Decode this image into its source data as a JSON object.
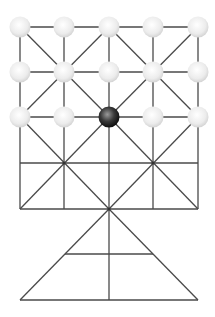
{
  "game": {
    "name": "board",
    "grid": {
      "cols_x": [
        20,
        64,
        109,
        153,
        198
      ],
      "rows_y": [
        27,
        72,
        117,
        163,
        209
      ]
    },
    "triangle": {
      "apex": [
        109,
        209
      ],
      "mid_y": 254,
      "mid_x": [
        65,
        153
      ],
      "base_y": 300,
      "base_x": [
        20,
        198
      ]
    },
    "colors": {
      "line": "#4a4a4a",
      "white_piece": "#efefef",
      "black_piece": "#2a2a2a",
      "background": "#ffffff"
    },
    "white_pieces": [
      [
        0,
        0
      ],
      [
        1,
        0
      ],
      [
        2,
        0
      ],
      [
        3,
        0
      ],
      [
        4,
        0
      ],
      [
        0,
        1
      ],
      [
        1,
        1
      ],
      [
        2,
        1
      ],
      [
        3,
        1
      ],
      [
        4,
        1
      ],
      [
        0,
        2
      ],
      [
        1,
        2
      ],
      [
        3,
        2
      ],
      [
        4,
        2
      ]
    ],
    "black_pieces": [
      [
        2,
        2
      ]
    ]
  }
}
